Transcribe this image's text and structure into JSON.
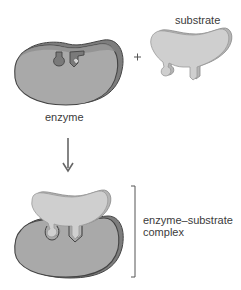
{
  "diagram": {
    "labels": {
      "enzyme": "enzyme",
      "substrate": "substrate",
      "complex": "enzyme–substrate complex"
    },
    "symbols": {
      "plus": "+",
      "arrow": "down-arrow",
      "bracket": "right-bracket"
    },
    "colors": {
      "enzyme_fill": "#a9a9a9",
      "enzyme_shadow": "#7d7d7d",
      "enzyme_outline": "#444444",
      "substrate_fill": "#cfcfcf",
      "substrate_shadow": "#b0b0b0",
      "active_site_fill": "#8a8a8a",
      "text": "#3b3b3b",
      "arrow": "#666666"
    }
  }
}
